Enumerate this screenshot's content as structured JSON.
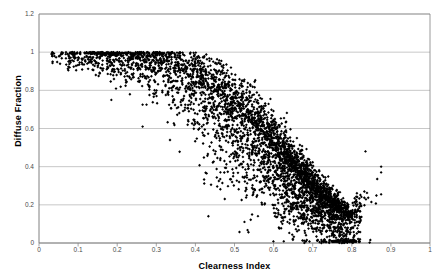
{
  "chart_data": {
    "type": "scatter",
    "title": "",
    "xlabel": "Clearness Index",
    "ylabel": "Diffuse Fraction",
    "xlim": [
      0,
      1
    ],
    "ylim": [
      0,
      1.2
    ],
    "xticks": [
      "0",
      "0.1",
      "0.2",
      "0.3",
      "0.4",
      "0.5",
      "0.6",
      "0.7",
      "0.8",
      "0.9",
      "1"
    ],
    "xtick_values": [
      0,
      0.1,
      0.2,
      0.3,
      0.4,
      0.5,
      0.6,
      0.7,
      0.8,
      0.9,
      1
    ],
    "yticks": [
      "0",
      "0.2",
      "0.4",
      "0.6",
      "0.8",
      "1",
      "1.2"
    ],
    "ytick_values": [
      0,
      0.2,
      0.4,
      0.6,
      0.8,
      1,
      1.2
    ],
    "grid": "horizontal",
    "legend": "none",
    "marker": "diamond",
    "marker_color": "#000000",
    "marker_size_px": 2.2,
    "point_count": 4200,
    "series": [
      {
        "name": "Diffuse fraction vs clearness index",
        "description": "Dense scatter: saturated plateau near DF=1.0 for Kt<0.3, monotonic decreasing band through the mid range, tight dense lobe at low DF for Kt 0.65-0.84, plus a small cluster pinned at DF=0 near Kt=0.78.",
        "x_range": [
          0.03,
          0.88
        ],
        "y_range": [
          0.0,
          1.02
        ],
        "summary_profile": {
          "x": [
            0.05,
            0.1,
            0.15,
            0.2,
            0.25,
            0.3,
            0.35,
            0.4,
            0.45,
            0.5,
            0.55,
            0.6,
            0.65,
            0.7,
            0.75,
            0.8,
            0.85
          ],
          "mean_y": [
            0.99,
            0.99,
            0.99,
            0.98,
            0.97,
            0.95,
            0.91,
            0.86,
            0.78,
            0.7,
            0.61,
            0.5,
            0.39,
            0.28,
            0.19,
            0.13,
            0.24
          ],
          "spread_y": [
            0.02,
            0.03,
            0.04,
            0.05,
            0.06,
            0.09,
            0.12,
            0.15,
            0.17,
            0.17,
            0.17,
            0.16,
            0.14,
            0.11,
            0.08,
            0.06,
            0.1
          ],
          "density": [
            40,
            90,
            130,
            150,
            170,
            200,
            240,
            300,
            360,
            420,
            480,
            560,
            640,
            700,
            640,
            380,
            60
          ]
        },
        "clusters": [
          {
            "name": "zero-line-cluster",
            "x_center": 0.782,
            "x_spread": 0.022,
            "y_center": 0.005,
            "y_spread": 0.008,
            "count": 70
          }
        ],
        "outliers": [
          {
            "x": 0.185,
            "y": 0.75
          },
          {
            "x": 0.265,
            "y": 0.61
          },
          {
            "x": 0.265,
            "y": 0.725
          },
          {
            "x": 0.275,
            "y": 0.725
          },
          {
            "x": 0.335,
            "y": 0.54
          },
          {
            "x": 0.44,
            "y": 0.305
          },
          {
            "x": 0.46,
            "y": 0.325
          },
          {
            "x": 0.645,
            "y": 0.165
          },
          {
            "x": 0.835,
            "y": 0.48
          },
          {
            "x": 0.875,
            "y": 0.4
          },
          {
            "x": 0.875,
            "y": 0.37
          },
          {
            "x": 0.865,
            "y": 0.335
          },
          {
            "x": 0.875,
            "y": 0.255
          },
          {
            "x": 0.075,
            "y": 0.905
          },
          {
            "x": 0.095,
            "y": 0.905
          },
          {
            "x": 0.115,
            "y": 0.935
          }
        ]
      }
    ]
  },
  "plot_geometry": {
    "left_px": 39,
    "right_px": 430,
    "top_px": 14,
    "bottom_px": 243,
    "gridline_color": "#b0b0b0",
    "frame_color": "#808080",
    "background": "#ffffff"
  }
}
